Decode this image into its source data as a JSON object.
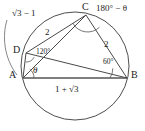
{
  "figure": {
    "type": "euclidean-geometry-diagram",
    "canvas": {
      "width": 145,
      "height": 131,
      "background": "#ffffff"
    },
    "stroke_color": "#444444",
    "text_color": "#1c1c1c",
    "circle": {
      "cx": 75,
      "cy": 66,
      "r": 54
    },
    "vertices": [
      {
        "id": "A",
        "label": "A",
        "x": 23,
        "y": 78,
        "label_x": 9,
        "label_y": 72
      },
      {
        "id": "B",
        "label": "B",
        "x": 127,
        "y": 78,
        "label_x": 130,
        "label_y": 72
      },
      {
        "id": "C",
        "label": "C",
        "x": 86,
        "y": 15,
        "label_x": 82,
        "label_y": 3
      },
      {
        "id": "D",
        "label": "D",
        "x": 26,
        "y": 53,
        "label_x": 13,
        "label_y": 46
      }
    ],
    "segments": [
      {
        "id": "AB",
        "from": "A",
        "to": "B",
        "style": "base"
      },
      {
        "id": "AD",
        "from": "A",
        "to": "D",
        "style": "chord"
      },
      {
        "id": "DC",
        "from": "D",
        "to": "C",
        "style": "chord"
      },
      {
        "id": "CB",
        "from": "C",
        "to": "B",
        "style": "chord"
      },
      {
        "id": "AC",
        "from": "A",
        "to": "C",
        "style": "chord"
      },
      {
        "id": "DB",
        "from": "D",
        "to": "B",
        "style": "chord"
      }
    ],
    "side_labels": [
      {
        "id": "AD-length",
        "text": "√3 − 1",
        "for": "AD",
        "x": 8,
        "y": 11
      },
      {
        "id": "DC-length",
        "text": "2",
        "for": "DC",
        "x": 45,
        "y": 29
      },
      {
        "id": "CB-length",
        "text": "2",
        "for": "CB",
        "x": 105,
        "y": 40
      },
      {
        "id": "AB-length",
        "text": "1 + √3",
        "for": "AB",
        "x": 56,
        "y": 84
      }
    ],
    "angle_labels": [
      {
        "id": "angle-at-A",
        "text": "θ",
        "at": "A",
        "x": 33,
        "y": 67
      },
      {
        "id": "angle-at-D",
        "text": "120°",
        "at": "D",
        "x": 36,
        "y": 48
      },
      {
        "id": "angle-at-B",
        "text": "60°",
        "at": "B",
        "x": 103,
        "y": 58
      },
      {
        "id": "angle-at-C",
        "text": "180° − θ",
        "at": "C",
        "x": 97,
        "y": 5
      }
    ],
    "leader_note": "curved leader line from the √3−1 label to side AD"
  }
}
